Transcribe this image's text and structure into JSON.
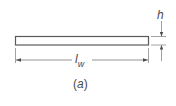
{
  "figure": {
    "caption_open": "(",
    "caption_letter": "a",
    "caption_close": ")",
    "dimensions": {
      "thickness": {
        "symbol": "h"
      },
      "length": {
        "symbol": "l",
        "subscript": "w"
      }
    },
    "colors": {
      "stroke": "#5a5a5a",
      "fill": "#ffffff",
      "text": "#4a4a4a"
    }
  }
}
